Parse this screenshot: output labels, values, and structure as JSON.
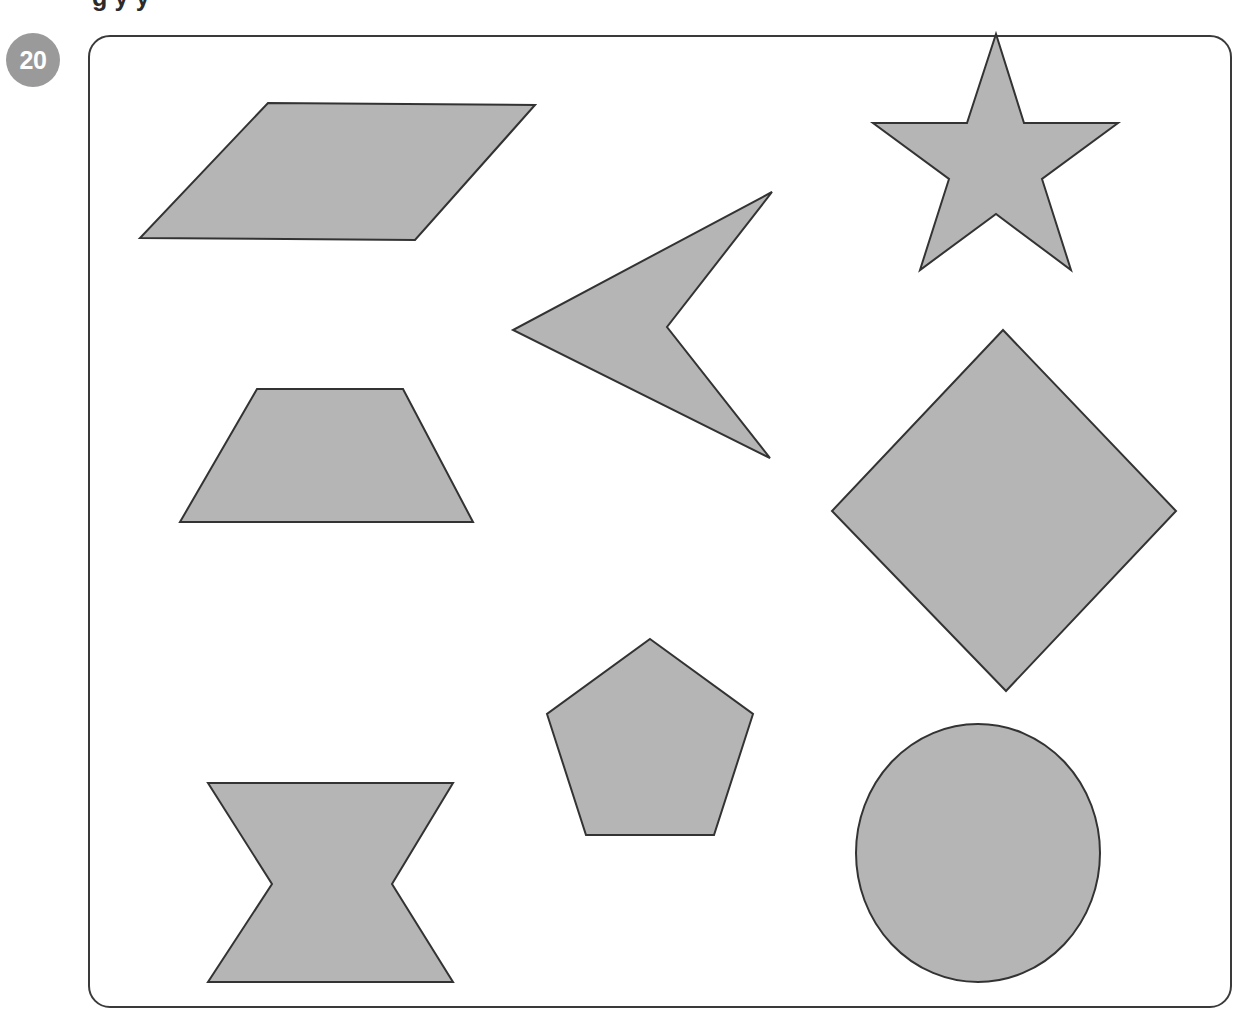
{
  "page": {
    "background_color": "#ffffff",
    "width": 1238,
    "height": 1016,
    "cut_off_heading": "g y y"
  },
  "badge": {
    "label": "20",
    "fill_color": "#9a9a9a",
    "text_color": "#ffffff"
  },
  "frame": {
    "name": "shape-panel",
    "stroke_color": "#3a3a3a",
    "fill_color": "#ffffff",
    "corner_radius": 22
  },
  "style": {
    "shape_fill": "#b5b5b5",
    "shape_stroke": "#333333",
    "shape_stroke_width": 2
  },
  "shapes": [
    {
      "id": "parallelogram",
      "label": "Parallelogram",
      "type": "polygon",
      "points": "268,103 535,105 415,240 140,238"
    },
    {
      "id": "star",
      "label": "Five-pointed star",
      "type": "polygon",
      "points": "996,34 1024,123 1118,123 1042,179 1071,270 996,214 920,270 949,179 873,123 967,123"
    },
    {
      "id": "arrow-dart",
      "label": "Concave arrow pointing left",
      "type": "polygon",
      "points": "772,192 513,330 770,458 667,327"
    },
    {
      "id": "trapezoid",
      "label": "Trapezoid",
      "type": "polygon",
      "points": "257,389 403,389 473,522 180,522"
    },
    {
      "id": "diamond",
      "label": "Diamond (rotated square)",
      "type": "polygon",
      "points": "1003,330 1176,511 1006,691 832,511"
    },
    {
      "id": "pentagon",
      "label": "Pentagon",
      "type": "polygon",
      "points": "650,639 753,714 714,835 586,835 547,714"
    },
    {
      "id": "hourglass",
      "label": "Concave hexagon (bowtie)",
      "type": "polygon",
      "points": "208,783 453,783 392,884 453,982 208,982 272,884"
    },
    {
      "id": "ellipse",
      "label": "Ellipse",
      "type": "ellipse",
      "cx": 978,
      "cy": 853,
      "rx": 122,
      "ry": 129
    }
  ]
}
